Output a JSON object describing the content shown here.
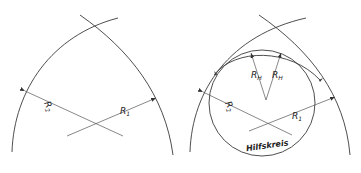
{
  "figure": {
    "left": {
      "labels": {
        "r1": "R",
        "r1_sub": "1",
        "r2": "R",
        "r2_sub": "2"
      }
    },
    "right": {
      "labels": {
        "r1": "R",
        "r1_sub": "1",
        "r2": "R",
        "r2_sub": "2",
        "rh_left": "R",
        "rh_left_sub": "H",
        "rh_right": "R",
        "rh_right_sub": "H",
        "auxiliary_circle": "Hilfskreis"
      }
    },
    "colors": {
      "line": "#3a3a3a",
      "background": "#ffffff"
    }
  }
}
